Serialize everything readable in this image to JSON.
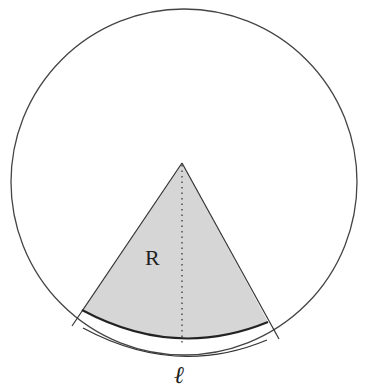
{
  "diagram": {
    "colors": {
      "stroke": "#333333",
      "sector_fill": "#d6d6d6",
      "background": "#ffffff"
    },
    "labels": {
      "region": "R",
      "arc_length": "ℓ"
    }
  }
}
